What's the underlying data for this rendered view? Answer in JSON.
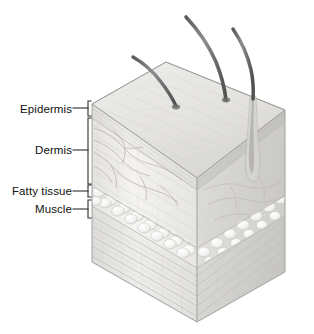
{
  "figure": {
    "background_color": "#ffffff",
    "width": 314,
    "height": 334
  },
  "labels": {
    "epidermis": "Epidermis",
    "dermis": "Dermis",
    "fatty_tissue": "Fatty tissue",
    "muscle": "Muscle"
  },
  "diagram": {
    "style": "pencil-shaded anatomical illustration",
    "view": "three-quarter isometric block",
    "leader_line_color": "#3a3a3a",
    "outline_color": "#8d8d8d",
    "hairs": [
      {
        "id": "hair-left",
        "tip_x": 133,
        "tip_y": 57,
        "root_x": 175,
        "root_y": 103
      },
      {
        "id": "hair-middle",
        "tip_x": 186,
        "tip_y": 17,
        "root_x": 224,
        "root_y": 98
      },
      {
        "id": "hair-right",
        "tip_x": 233,
        "tip_y": 29,
        "root_x": 262,
        "root_y": 88
      }
    ],
    "layers": [
      {
        "name": "Epidermis",
        "front_top_y": 104,
        "front_bottom_y": 118,
        "fill": "#e8e7e4"
      },
      {
        "name": "Dermis",
        "front_top_y": 118,
        "front_bottom_y": 186,
        "fill": "#eeedea"
      },
      {
        "name": "Fatty tissue",
        "front_top_y": 186,
        "front_bottom_y": 206,
        "fill": "#f1f0ee"
      },
      {
        "name": "Muscle",
        "front_top_y": 206,
        "front_bottom_y": 262,
        "fill": "#e9e8e6"
      }
    ],
    "brackets": [
      {
        "for": "Epidermis",
        "top_y": 101,
        "bottom_y": 116,
        "x": 88,
        "leader_y": 108
      },
      {
        "for": "Dermis",
        "top_y": 118,
        "bottom_y": 184,
        "x": 88,
        "leader_y": 150
      },
      {
        "for": "Fatty tissue",
        "top_y": 184,
        "bottom_y": 198,
        "x": 88,
        "leader_y": 191
      },
      {
        "for": "Muscle",
        "top_y": 200,
        "bottom_y": 218,
        "x": 88,
        "leader_y": 209
      }
    ]
  }
}
